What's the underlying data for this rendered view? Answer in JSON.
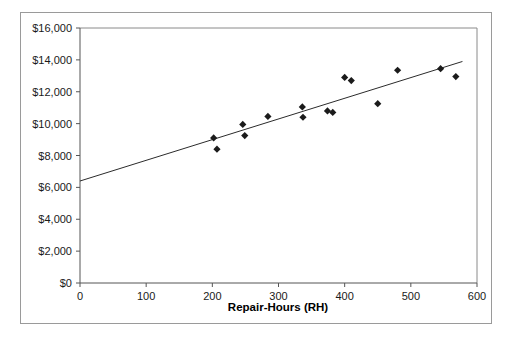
{
  "chart_data": {
    "type": "scatter",
    "title": "",
    "xlabel": "Repair-Hours (RH)",
    "ylabel": "",
    "xlim": [
      0,
      600
    ],
    "ylim": [
      0,
      16000
    ],
    "grid": false,
    "legend": null,
    "x_ticks": [
      "0",
      "100",
      "200",
      "300",
      "400",
      "500",
      "600"
    ],
    "x_tick_values": [
      0,
      100,
      200,
      300,
      400,
      500,
      600
    ],
    "y_ticks": [
      "$0",
      "$2,000",
      "$4,000",
      "$6,000",
      "$8,000",
      "$10,000",
      "$12,000",
      "$14,000",
      "$16,000"
    ],
    "y_tick_values": [
      0,
      2000,
      4000,
      6000,
      8000,
      10000,
      12000,
      14000,
      16000
    ],
    "marker_shape": "diamond",
    "marker_color": "#1b1b1b",
    "series": [
      {
        "name": "Repair cost observations",
        "points": [
          {
            "x": 202,
            "y": 9100
          },
          {
            "x": 207,
            "y": 8400
          },
          {
            "x": 246,
            "y": 9950
          },
          {
            "x": 249,
            "y": 9250
          },
          {
            "x": 284,
            "y": 10450
          },
          {
            "x": 336,
            "y": 11050
          },
          {
            "x": 337,
            "y": 10400
          },
          {
            "x": 374,
            "y": 10800
          },
          {
            "x": 382,
            "y": 10700
          },
          {
            "x": 400,
            "y": 12900
          },
          {
            "x": 410,
            "y": 12700
          },
          {
            "x": 450,
            "y": 11250
          },
          {
            "x": 480,
            "y": 13350
          },
          {
            "x": 545,
            "y": 13450
          },
          {
            "x": 568,
            "y": 12950
          }
        ]
      }
    ],
    "trend_line": {
      "name": "linear fit",
      "x_start": 0,
      "y_start": 6400,
      "x_end": 578,
      "y_end": 13900,
      "slope": 12.98,
      "intercept": 6400,
      "color": "#2b2b2b"
    }
  }
}
